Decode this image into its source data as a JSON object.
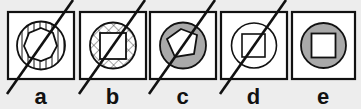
{
  "question": {
    "options": [
      {
        "id": "a",
        "label": "a",
        "outer": "circle",
        "ring_fill": "vertical-lines",
        "inner": "heptagon",
        "inner_fill": "white",
        "crossed_out": true
      },
      {
        "id": "b",
        "label": "b",
        "outer": "circle",
        "ring_fill": "crosshatch",
        "inner": "square",
        "inner_fill": "white",
        "crossed_out": true
      },
      {
        "id": "c",
        "label": "c",
        "outer": "circle",
        "ring_fill": "gray",
        "inner": "pentagon",
        "inner_fill": "white",
        "crossed_out": true
      },
      {
        "id": "d",
        "label": "d",
        "outer": "circle",
        "ring_fill": "white",
        "inner": "square",
        "inner_fill": "white",
        "crossed_out": true
      },
      {
        "id": "e",
        "label": "e",
        "outer": "circle",
        "ring_fill": "gray",
        "inner": "square",
        "inner_fill": "white",
        "crossed_out": false
      }
    ]
  },
  "colors": {
    "background": "#ededed",
    "stroke": "#111111",
    "gray_fill": "#a9a9a9",
    "box_fill": "#ffffff"
  }
}
